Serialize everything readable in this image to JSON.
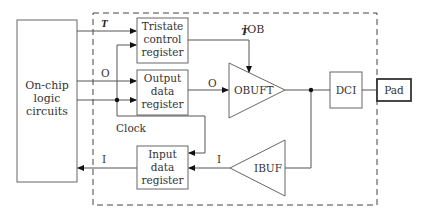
{
  "diagram": {
    "iob_label": "IOB",
    "onchip": {
      "line1": "On-chip",
      "line2": "logic",
      "line3": "circuits"
    },
    "tristate_reg": {
      "line1": "Tristate",
      "line2": "control",
      "line3": "register"
    },
    "output_reg": {
      "line1": "Output",
      "line2": "data",
      "line3": "register"
    },
    "input_reg": {
      "line1": "Input",
      "line2": "data",
      "line3": "register"
    },
    "obuft": "OBUFT",
    "ibuf": "IBUF",
    "dci": "DCI",
    "pad": "Pad",
    "signals": {
      "t_in": "T",
      "t_out": "T",
      "o_in": "O",
      "o_out": "O",
      "clock": "Clock",
      "i_out": "I",
      "i_in": "I"
    },
    "colors": {
      "stroke": "#666666",
      "pad_stroke": "#333333",
      "arrow": "#111111"
    }
  }
}
